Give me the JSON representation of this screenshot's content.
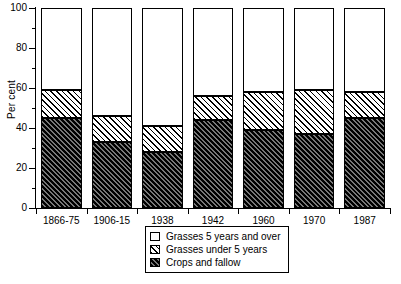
{
  "chart_data": {
    "type": "bar",
    "title": "",
    "subtitle": "",
    "xlabel": "",
    "ylabel": "Per cent",
    "ylim": [
      0,
      100
    ],
    "yticks": [
      0,
      20,
      40,
      60,
      80,
      100
    ],
    "ytick_labels": [
      "0",
      "20",
      "40",
      "60",
      "80",
      "100"
    ],
    "yminor_ticks": [
      10,
      30,
      50,
      70,
      90
    ],
    "grid": false,
    "stacked": true,
    "stack_total": 100,
    "legend_position": "bottom-center",
    "categories": [
      "1866-75",
      "1906-15",
      "1938",
      "1942",
      "1960",
      "1970",
      "1987"
    ],
    "series": [
      {
        "name": "Crops and fallow",
        "pattern": "dark-diagonal-hatch",
        "values": [
          45,
          33,
          28,
          44,
          39,
          37,
          45
        ]
      },
      {
        "name": "Grasses under 5 years",
        "pattern": "light-diagonal-hatch",
        "values": [
          14,
          13,
          13,
          12,
          19,
          22,
          13
        ]
      },
      {
        "name": "Grasses 5 years and over",
        "pattern": "white",
        "values": [
          41,
          54,
          59,
          44,
          42,
          41,
          42
        ]
      }
    ],
    "legend_entries": [
      {
        "label": "Grasses 5 years and over",
        "pattern": "white"
      },
      {
        "label": "Grasses under 5 years",
        "pattern": "light-diagonal-hatch"
      },
      {
        "label": "Crops and fallow",
        "pattern": "dark-diagonal-hatch"
      }
    ],
    "colors": {
      "axis": "#000000",
      "text": "#000000",
      "background": "#ffffff",
      "dark_hatch": "#2e2e2e",
      "light_hatch": "#ffffff"
    }
  }
}
